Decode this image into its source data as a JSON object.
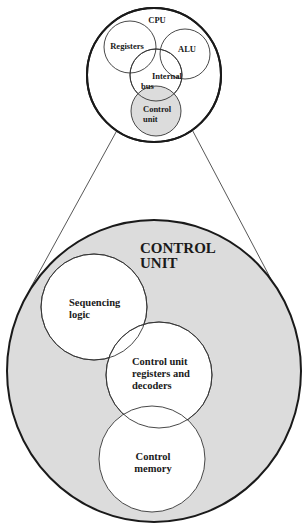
{
  "diagram": {
    "type": "venn-zoom",
    "colors": {
      "background": "#ffffff",
      "stroke": "#222222",
      "shaded_fill": "#dcdcdc",
      "inner_fill": "#ffffff"
    },
    "cpu": {
      "title": "CPU",
      "components": [
        {
          "id": "registers",
          "label": "Registers"
        },
        {
          "id": "alu",
          "label": "ALU"
        },
        {
          "id": "internal-bus",
          "label_line1": "Internal",
          "label_line2": "bus"
        },
        {
          "id": "control-unit",
          "label_line1": "Control",
          "label_line2": "unit",
          "highlighted": true
        }
      ]
    },
    "control_unit": {
      "title_line1": "CONTROL",
      "title_line2": "UNIT",
      "components": [
        {
          "id": "sequencing-logic",
          "label_line1": "Sequencing",
          "label_line2": "logic"
        },
        {
          "id": "cu-registers-decoders",
          "label_line1": "Control unit",
          "label_line2": "registers and",
          "label_line3": "decoders"
        },
        {
          "id": "control-memory",
          "label_line1": "Control",
          "label_line2": "memory"
        }
      ]
    }
  }
}
